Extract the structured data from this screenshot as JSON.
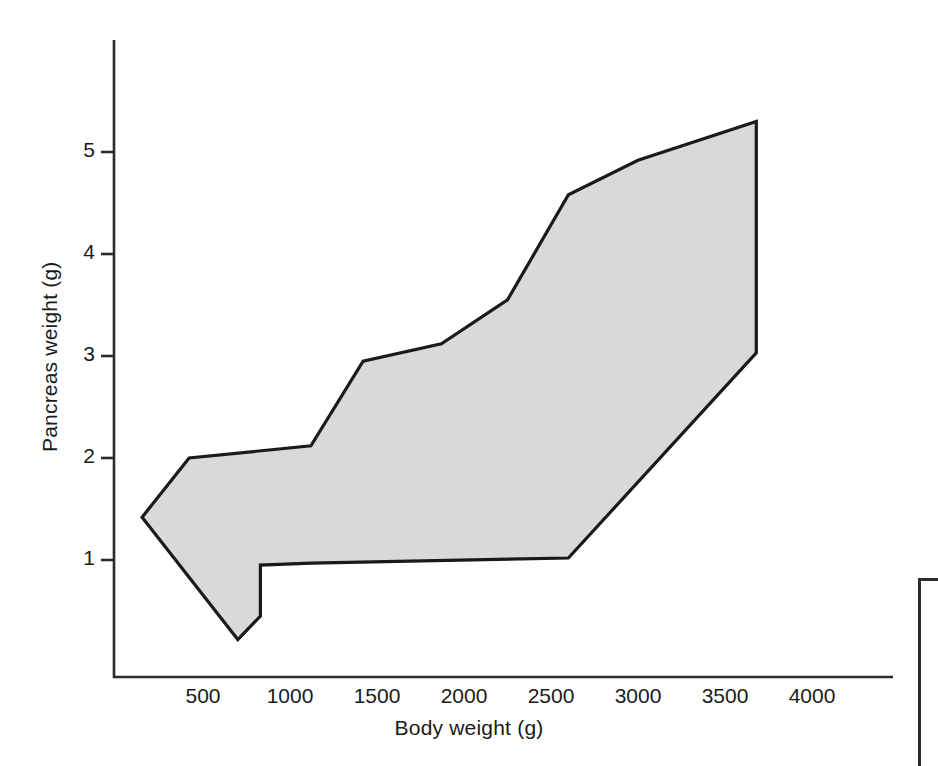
{
  "figure": {
    "background": "#ffffff",
    "line_color": "#1a1a1a",
    "band_fill": "#d9d9d9",
    "band_stroke": "#1a1a1a"
  },
  "axes": {
    "x": {
      "label": "Body weight (g)",
      "ticks": [
        {
          "value": 500,
          "text": "500"
        },
        {
          "value": 1000,
          "text": "1000"
        },
        {
          "value": 1500,
          "text": "1500"
        },
        {
          "value": 2000,
          "text": "2000"
        },
        {
          "value": 2500,
          "text": "2500"
        },
        {
          "value": 3000,
          "text": "3000"
        },
        {
          "value": 3500,
          "text": "3500"
        },
        {
          "value": 4000,
          "text": "4000"
        }
      ],
      "range": [
        0,
        4450
      ],
      "tick_marks": false
    },
    "y": {
      "label": "Pancreas weight (g)",
      "ticks": [
        {
          "value": 1,
          "text": "1"
        },
        {
          "value": 2,
          "text": "2"
        },
        {
          "value": 3,
          "text": "3"
        },
        {
          "value": 4,
          "text": "4"
        },
        {
          "value": 5,
          "text": "5"
        }
      ],
      "range": [
        -0.1,
        6.0
      ],
      "tick_marks": true
    },
    "grid": false,
    "spines": [
      "left",
      "bottom"
    ]
  },
  "chart_data": {
    "type": "area",
    "title": "",
    "xlabel": "Body weight (g)",
    "ylabel": "Pancreas weight (g)",
    "xlim": [
      0,
      4450
    ],
    "ylim": [
      -0.1,
      6.0
    ],
    "grid": false,
    "legend": null,
    "series": [
      {
        "name": "Upper boundary",
        "x": [
          150,
          420,
          1120,
          1420,
          1870,
          2250,
          2600,
          3000,
          3680
        ],
        "values": [
          1.42,
          2.0,
          2.12,
          2.95,
          3.12,
          3.55,
          4.58,
          4.92,
          5.3
        ]
      },
      {
        "name": "Lower boundary",
        "x": [
          150,
          700,
          830,
          830,
          1120,
          2600,
          3680
        ],
        "values": [
          1.42,
          0.22,
          0.45,
          0.95,
          0.97,
          1.02,
          3.03
        ]
      }
    ],
    "band": {
      "fill": "#d9d9d9",
      "outline": "#1a1a1a",
      "polygon": [
        [
          150,
          1.42
        ],
        [
          420,
          2.0
        ],
        [
          1120,
          2.12
        ],
        [
          1420,
          2.95
        ],
        [
          1870,
          3.12
        ],
        [
          2250,
          3.55
        ],
        [
          2600,
          4.58
        ],
        [
          3000,
          4.92
        ],
        [
          3680,
          5.3
        ],
        [
          3680,
          3.03
        ],
        [
          2600,
          1.02
        ],
        [
          1120,
          0.97
        ],
        [
          830,
          0.95
        ],
        [
          830,
          0.45
        ],
        [
          700,
          0.22
        ]
      ]
    }
  }
}
